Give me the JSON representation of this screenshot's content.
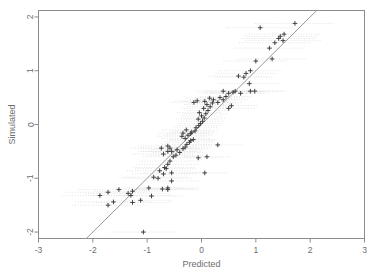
{
  "chart_data": {
    "type": "scatter",
    "title": "",
    "xlabel": "Predicted",
    "ylabel": "Simulated",
    "xlim": [
      -3,
      3
    ],
    "ylim": [
      -2.12,
      2.12
    ],
    "xticks": [
      -3,
      -2,
      -1,
      0,
      1,
      2,
      3
    ],
    "xticklabels": [
      "-3",
      "-2",
      "-1",
      "0",
      "1",
      "2",
      "3"
    ],
    "yticks": [
      -2,
      -1,
      0,
      1,
      2
    ],
    "yticklabels": [
      "-2",
      "-1",
      "0",
      "1",
      "2"
    ],
    "grid": false,
    "legend": null,
    "marker": "plus",
    "marker_color": "#3a3a3a",
    "frame_color": "#8c8c8c",
    "errorbar_color": "#d9d9d9",
    "errorbar_style": "dotted-horizontal",
    "reference_line": {
      "label": "1:1 line",
      "type": "line",
      "color": "#8a8a8a",
      "x": [
        -2.12,
        2.12
      ],
      "y": [
        -2.12,
        2.12
      ]
    },
    "points": [
      {
        "x": -1.07,
        "y": -2.0,
        "xerr": 0.62
      },
      {
        "x": -1.27,
        "y": -1.45,
        "xerr": 0.72
      },
      {
        "x": -1.62,
        "y": -1.44,
        "xerr": 0.7
      },
      {
        "x": -1.72,
        "y": -1.5,
        "xerr": 0.66
      },
      {
        "x": -1.12,
        "y": -1.41,
        "xerr": 0.6
      },
      {
        "x": -1.3,
        "y": -1.32,
        "xerr": 0.75
      },
      {
        "x": -1.35,
        "y": -1.28,
        "xerr": 0.78
      },
      {
        "x": -1.27,
        "y": -1.24,
        "xerr": 0.7
      },
      {
        "x": -1.72,
        "y": -1.26,
        "xerr": 0.8
      },
      {
        "x": -1.52,
        "y": -1.21,
        "xerr": 0.74
      },
      {
        "x": -1.87,
        "y": -1.32,
        "xerr": 0.7
      },
      {
        "x": -0.92,
        "y": -1.33,
        "xerr": 0.62
      },
      {
        "x": -0.72,
        "y": -1.2,
        "xerr": 0.58
      },
      {
        "x": -0.97,
        "y": -1.18,
        "xerr": 0.65
      },
      {
        "x": -0.62,
        "y": -1.21,
        "xerr": 0.6
      },
      {
        "x": -0.55,
        "y": -1.05,
        "xerr": 0.55
      },
      {
        "x": -0.8,
        "y": -1.0,
        "xerr": 0.64
      },
      {
        "x": -0.88,
        "y": -0.98,
        "xerr": 0.63
      },
      {
        "x": -0.77,
        "y": -0.86,
        "xerr": 0.6
      },
      {
        "x": -0.68,
        "y": -0.8,
        "xerr": 0.57
      },
      {
        "x": -0.62,
        "y": -0.74,
        "xerr": 0.58
      },
      {
        "x": -0.58,
        "y": -0.68,
        "xerr": 0.56
      },
      {
        "x": -0.52,
        "y": -0.6,
        "xerr": 0.55
      },
      {
        "x": -0.47,
        "y": -0.57,
        "xerr": 0.52
      },
      {
        "x": -0.55,
        "y": -0.5,
        "xerr": 0.54
      },
      {
        "x": -0.45,
        "y": -0.47,
        "xerr": 0.5
      },
      {
        "x": -0.4,
        "y": -0.52,
        "xerr": 0.5
      },
      {
        "x": -0.34,
        "y": -0.45,
        "xerr": 0.48
      },
      {
        "x": -0.3,
        "y": -0.42,
        "xerr": 0.47
      },
      {
        "x": -0.27,
        "y": -0.37,
        "xerr": 0.46
      },
      {
        "x": -0.22,
        "y": -0.33,
        "xerr": 0.45
      },
      {
        "x": -0.2,
        "y": -0.3,
        "xerr": 0.44
      },
      {
        "x": -0.15,
        "y": -0.28,
        "xerr": 0.43
      },
      {
        "x": -0.3,
        "y": -0.26,
        "xerr": 0.44
      },
      {
        "x": -0.36,
        "y": -0.22,
        "xerr": 0.46
      },
      {
        "x": -0.25,
        "y": -0.2,
        "xerr": 0.44
      },
      {
        "x": -0.2,
        "y": -0.17,
        "xerr": 0.43
      },
      {
        "x": -0.18,
        "y": -0.14,
        "xerr": 0.42
      },
      {
        "x": -0.12,
        "y": -0.12,
        "xerr": 0.42
      },
      {
        "x": -0.28,
        "y": -0.1,
        "xerr": 0.44
      },
      {
        "x": -0.34,
        "y": -0.16,
        "xerr": 0.45
      },
      {
        "x": -0.1,
        "y": -0.06,
        "xerr": 0.4
      },
      {
        "x": -0.05,
        "y": -0.02,
        "xerr": 0.4
      },
      {
        "x": -0.02,
        "y": 0.02,
        "xerr": 0.4
      },
      {
        "x": 0.02,
        "y": 0.06,
        "xerr": 0.4
      },
      {
        "x": -0.06,
        "y": 0.1,
        "xerr": 0.41
      },
      {
        "x": 0.05,
        "y": 0.12,
        "xerr": 0.4
      },
      {
        "x": 0.0,
        "y": 0.16,
        "xerr": 0.4
      },
      {
        "x": 0.08,
        "y": 0.2,
        "xerr": 0.41
      },
      {
        "x": -0.04,
        "y": 0.22,
        "xerr": 0.41
      },
      {
        "x": 0.12,
        "y": 0.26,
        "xerr": 0.42
      },
      {
        "x": 0.04,
        "y": 0.3,
        "xerr": 0.41
      },
      {
        "x": 0.16,
        "y": 0.33,
        "xerr": 0.43
      },
      {
        "x": 0.1,
        "y": 0.37,
        "xerr": 0.42
      },
      {
        "x": 0.2,
        "y": 0.4,
        "xerr": 0.44
      },
      {
        "x": 0.06,
        "y": 0.43,
        "xerr": 0.42
      },
      {
        "x": 0.3,
        "y": 0.41,
        "xerr": 0.45
      },
      {
        "x": 0.22,
        "y": 0.46,
        "xerr": 0.44
      },
      {
        "x": 0.15,
        "y": 0.49,
        "xerr": 0.43
      },
      {
        "x": -0.08,
        "y": 0.44,
        "xerr": 0.42
      },
      {
        "x": -0.14,
        "y": 0.41,
        "xerr": 0.43
      },
      {
        "x": 0.34,
        "y": 0.5,
        "xerr": 0.46
      },
      {
        "x": 0.4,
        "y": 0.46,
        "xerr": 0.47
      },
      {
        "x": 0.45,
        "y": 0.52,
        "xerr": 0.48
      },
      {
        "x": 0.5,
        "y": 0.58,
        "xerr": 0.5
      },
      {
        "x": 0.58,
        "y": 0.6,
        "xerr": 0.52
      },
      {
        "x": 0.62,
        "y": 0.62,
        "xerr": 0.54
      },
      {
        "x": 0.9,
        "y": 0.62,
        "xerr": 0.56
      },
      {
        "x": 0.4,
        "y": 0.62,
        "xerr": 0.48
      },
      {
        "x": 0.55,
        "y": 0.35,
        "xerr": 0.5
      },
      {
        "x": 0.5,
        "y": 0.3,
        "xerr": 0.5
      },
      {
        "x": 0.3,
        "y": -0.38,
        "xerr": 0.46
      },
      {
        "x": 0.1,
        "y": -0.6,
        "xerr": 0.42
      },
      {
        "x": -0.06,
        "y": -0.62,
        "xerr": 0.42
      },
      {
        "x": -0.62,
        "y": -0.5,
        "xerr": 0.55
      },
      {
        "x": -0.7,
        "y": -0.55,
        "xerr": 0.57
      },
      {
        "x": -0.58,
        "y": -0.44,
        "xerr": 0.54
      },
      {
        "x": -0.62,
        "y": -0.4,
        "xerr": 0.55
      },
      {
        "x": -0.74,
        "y": -0.44,
        "xerr": 0.58
      },
      {
        "x": -0.65,
        "y": -0.82,
        "xerr": 0.57
      },
      {
        "x": -0.55,
        "y": -0.9,
        "xerr": 0.55
      },
      {
        "x": -0.7,
        "y": -0.92,
        "xerr": 0.58
      },
      {
        "x": 0.06,
        "y": -0.9,
        "xerr": 0.42
      },
      {
        "x": -0.62,
        "y": -1.18,
        "xerr": 0.56
      },
      {
        "x": 0.68,
        "y": 0.9,
        "xerr": 0.54
      },
      {
        "x": 0.78,
        "y": 0.88,
        "xerr": 0.55
      },
      {
        "x": 0.82,
        "y": 0.95,
        "xerr": 0.56
      },
      {
        "x": 0.9,
        "y": 1.0,
        "xerr": 0.58
      },
      {
        "x": 0.88,
        "y": 0.76,
        "xerr": 0.57
      },
      {
        "x": 1.0,
        "y": 1.18,
        "xerr": 0.6
      },
      {
        "x": 1.08,
        "y": 1.8,
        "xerr": 0.62
      },
      {
        "x": 1.25,
        "y": 1.42,
        "xerr": 0.64
      },
      {
        "x": 1.35,
        "y": 1.52,
        "xerr": 0.66
      },
      {
        "x": 1.42,
        "y": 1.6,
        "xerr": 0.68
      },
      {
        "x": 1.45,
        "y": 1.64,
        "xerr": 0.68
      },
      {
        "x": 1.5,
        "y": 1.56,
        "xerr": 0.7
      },
      {
        "x": 1.52,
        "y": 1.68,
        "xerr": 0.7
      },
      {
        "x": 1.72,
        "y": 1.88,
        "xerr": 0.74
      },
      {
        "x": 1.3,
        "y": 1.22,
        "xerr": 0.64
      },
      {
        "x": 0.98,
        "y": 0.62,
        "xerr": 0.58
      },
      {
        "x": 0.72,
        "y": 0.58,
        "xerr": 0.55
      }
    ]
  }
}
